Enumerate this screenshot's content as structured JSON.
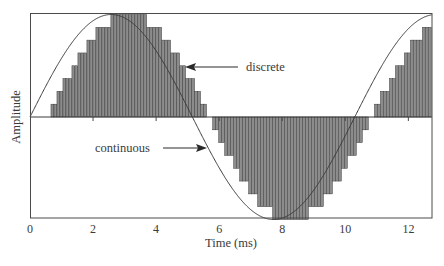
{
  "chart_data": {
    "type": "line",
    "title": "",
    "xlabel": "Time (ms)",
    "ylabel": "Amplitude",
    "xlim": [
      0,
      12.75
    ],
    "ylim": [
      -1,
      1
    ],
    "x_ticks": [
      0,
      2,
      4,
      6,
      8,
      10,
      12
    ],
    "x_tick_labels": [
      "0",
      "2",
      "4",
      "6",
      "8",
      "10",
      "12"
    ],
    "grid": false,
    "legend": null,
    "series": [
      {
        "name": "continuous",
        "style": "line",
        "description": "sine wave, period ~10.3 ms, starting at 0 amplitude at t=0",
        "period_ms": 10.3,
        "phase_ms": 0,
        "amplitude": 1.0
      },
      {
        "name": "discrete",
        "style": "bars",
        "description": "quantized sampled version of the sine, lagging the continuous curve (~0.55 ms delay), shown as thin vertical bars",
        "sample_interval_ms": 0.095,
        "delay_ms": 0.55,
        "quantization_steps": 16,
        "amplitude": 1.0
      }
    ],
    "annotations": [
      {
        "text": "discrete",
        "arrow_to_series": "discrete",
        "x_ms": 5.0,
        "y": 0.54
      },
      {
        "text": "continuous",
        "arrow_to_series": "continuous",
        "x_ms": 5.55,
        "y": -0.29
      }
    ]
  },
  "labels": {
    "xlabel": "Time (ms)",
    "ylabel": "Amplitude",
    "discrete": "discrete",
    "continuous": "continuous",
    "ticks": [
      "0",
      "2",
      "4",
      "6",
      "8",
      "10",
      "12"
    ]
  },
  "colors": {
    "bar_fill": "#8c8c8c",
    "bar_stroke": "#3c3c3c",
    "line": "#3a3a3a",
    "axis": "#4a4a4a"
  }
}
